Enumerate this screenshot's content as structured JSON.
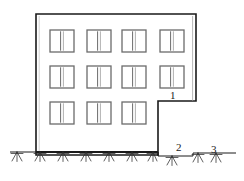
{
  "figure": {
    "type": "architectural-elevation-line-drawing",
    "title": "",
    "width": 244,
    "height": 181,
    "background_color": "#ffffff",
    "line_color": "#1a1a1a",
    "window_frame_color": "#6b6b6b",
    "ground_hatch_color": "#2b2b2b"
  },
  "building": {
    "description": "Four-storey-like building elevation with stepped right-hand edge",
    "outline": {
      "left_x": 36,
      "top_y": 14,
      "right_x": 196,
      "step_x": 158,
      "step_y": 101,
      "base_y": 155,
      "left_base_y": 152
    },
    "wall_line_width": 1.6,
    "window_rows": 3,
    "window_columns": 4,
    "bottom_row_columns": 3,
    "window_size": {
      "width": 24,
      "height": 22
    },
    "windows": [
      {
        "row": 0,
        "col": 0,
        "x": 50,
        "y": 30
      },
      {
        "row": 0,
        "col": 1,
        "x": 87,
        "y": 30
      },
      {
        "row": 0,
        "col": 2,
        "x": 122,
        "y": 30
      },
      {
        "row": 0,
        "col": 3,
        "x": 160,
        "y": 30
      },
      {
        "row": 1,
        "col": 0,
        "x": 50,
        "y": 66
      },
      {
        "row": 1,
        "col": 1,
        "x": 87,
        "y": 66
      },
      {
        "row": 1,
        "col": 2,
        "x": 122,
        "y": 66
      },
      {
        "row": 1,
        "col": 3,
        "x": 160,
        "y": 66
      },
      {
        "row": 2,
        "col": 0,
        "x": 50,
        "y": 102
      },
      {
        "row": 2,
        "col": 1,
        "x": 87,
        "y": 102
      },
      {
        "row": 2,
        "col": 2,
        "x": 122,
        "y": 102
      }
    ]
  },
  "ground": {
    "description": "Hatched earth symbol along grade line with a small step to the right",
    "segments": [
      {
        "name": "left-grade",
        "x1": 10,
        "x2": 36,
        "y": 152
      },
      {
        "name": "under-building-grade",
        "x1": 36,
        "x2": 158,
        "y": 152
      },
      {
        "name": "mid-grade",
        "x1": 158,
        "x2": 193,
        "y": 156
      },
      {
        "name": "right-grade",
        "x1": 193,
        "x2": 236,
        "y": 153
      }
    ],
    "hatch_positions": [
      17,
      40,
      63,
      86,
      109,
      132,
      155,
      172,
      196,
      214
    ],
    "hatch_length": 9
  },
  "callouts": [
    {
      "id": "1",
      "label": "1",
      "x": 170,
      "y": 90,
      "refers_to": "building-step-soffit"
    },
    {
      "id": "2",
      "label": "2",
      "x": 176,
      "y": 142,
      "refers_to": "lower-grade-area"
    },
    {
      "id": "3",
      "label": "3",
      "x": 211,
      "y": 144,
      "refers_to": "upper-grade-area"
    }
  ]
}
